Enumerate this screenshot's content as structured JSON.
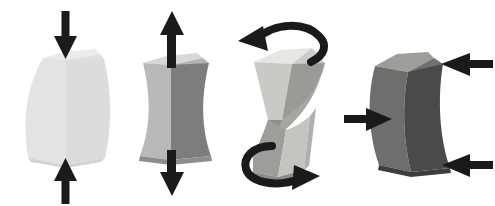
{
  "figure": {
    "background_color": "#ffffff",
    "width": 495,
    "height": 206,
    "panel_count": 4
  },
  "palette": {
    "arrow_black": "#1a1a1a",
    "compression_left_face": "#e3e3e1",
    "compression_right_face": "#dedddb",
    "compression_top_face": "#ebebe9",
    "tension_left_face": "#b9b9b7",
    "tension_right_face": "#7d7d7b",
    "tension_top_face": "#d8d8d6",
    "torsion_light_face": "#c9c9c6",
    "torsion_mid_face": "#9a9a97",
    "torsion_top_face": "#e6e6e3",
    "shear_left_face": "#6e6e6c",
    "shear_right_face": "#4a4a49",
    "shear_top_face": "#9d9d9a"
  },
  "panels": [
    {
      "id": "compression",
      "name": "compression-block",
      "label": "Compression",
      "shape": "barrel-bulged block",
      "arrow_count": 2,
      "arrows": [
        {
          "name": "compression-arrow-top",
          "direction": "down",
          "label": "downward load"
        },
        {
          "name": "compression-arrow-bottom",
          "direction": "up",
          "label": "upward load"
        }
      ]
    },
    {
      "id": "tension",
      "name": "tension-block",
      "label": "Tension",
      "shape": "hourglass-pinched block",
      "arrow_count": 2,
      "arrows": [
        {
          "name": "tension-arrow-top",
          "direction": "up",
          "label": "upward pull"
        },
        {
          "name": "tension-arrow-bottom",
          "direction": "down",
          "label": "downward pull"
        }
      ]
    },
    {
      "id": "torsion",
      "name": "torsion-block",
      "label": "Torsion",
      "shape": "twisted hourglass block",
      "arrow_count": 2,
      "arrows": [
        {
          "name": "torsion-arrow-top",
          "direction": "curved-left",
          "label": "top rotation"
        },
        {
          "name": "torsion-arrow-bottom",
          "direction": "curved-right",
          "label": "bottom rotation"
        }
      ]
    },
    {
      "id": "shear",
      "name": "shear-block",
      "label": "Shear",
      "shape": "skewed curved block",
      "arrow_count": 3,
      "arrows": [
        {
          "name": "shear-arrow-top-right",
          "direction": "left",
          "label": "upper shear load"
        },
        {
          "name": "shear-arrow-middle-left",
          "direction": "right",
          "label": "lower shear load"
        },
        {
          "name": "shear-arrow-bottom-right",
          "direction": "left",
          "label": "base shear load"
        }
      ]
    }
  ]
}
